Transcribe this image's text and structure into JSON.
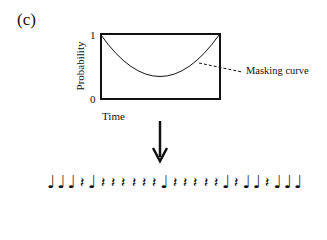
{
  "panel_label": "(c)",
  "plot": {
    "y_axis_label": "Probability",
    "y_ticks": [
      "1",
      "0"
    ],
    "x_axis_label": "Time",
    "curve_label": "Masking curve"
  },
  "arrow": "down-arrow",
  "sequence": {
    "legend": {
      "N": "note",
      "R": "rest"
    },
    "symbols": [
      "N",
      "N",
      "N",
      "R",
      "N",
      "R",
      "R",
      "R",
      "R",
      "R",
      "R",
      "N",
      "R",
      "R",
      "R",
      "R",
      "R",
      "N",
      "R",
      "N",
      "N",
      "R",
      "N",
      "N",
      "N"
    ],
    "glyphs": {
      "N": "♩",
      "R": "𝄽"
    }
  }
}
